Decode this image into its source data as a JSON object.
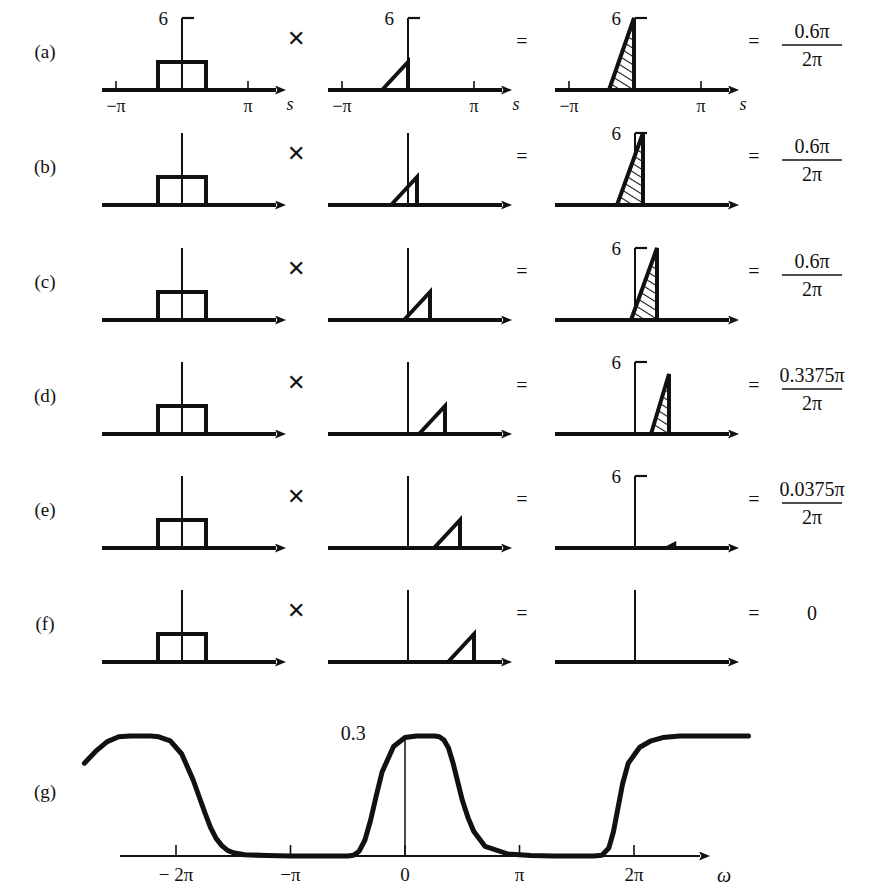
{
  "figure": {
    "kind": "graphical-convolution-illustration",
    "background": "#ffffff",
    "ink": "#111111",
    "rows": [
      {
        "id": "a",
        "label": "(a)",
        "operator_multiply": "✕",
        "operator_equals_1": "=",
        "operator_equals_2": "=",
        "panel1": {
          "peak_label": "6",
          "left_tick": "−π",
          "right_tick": "π",
          "axis_var": "s",
          "show_axis_labels": true
        },
        "panel2": {
          "peak_label": "6",
          "left_tick": "−π",
          "right_tick": "π",
          "axis_var": "s",
          "show_axis_labels": true
        },
        "panel3": {
          "peak_label": "6",
          "left_tick": "−π",
          "right_tick": "π",
          "axis_var": "s",
          "show_axis_labels": true
        },
        "result": {
          "numerator": "0.6π",
          "denominator": "2π",
          "is_fraction": true
        },
        "shift": 0
      },
      {
        "id": "b",
        "label": "(b)",
        "operator_multiply": "✕",
        "operator_equals_1": "=",
        "operator_equals_2": "=",
        "panel1": {
          "peak_label": "",
          "show_axis_labels": false
        },
        "panel2": {
          "peak_label": "",
          "show_axis_labels": false
        },
        "panel3": {
          "peak_label": "6",
          "show_axis_labels": false
        },
        "result": {
          "numerator": "0.6π",
          "denominator": "2π",
          "is_fraction": true
        },
        "shift": 1
      },
      {
        "id": "c",
        "label": "(c)",
        "operator_multiply": "✕",
        "operator_equals_1": "=",
        "operator_equals_2": "=",
        "panel1": {
          "peak_label": "",
          "show_axis_labels": false
        },
        "panel2": {
          "peak_label": "",
          "show_axis_labels": false
        },
        "panel3": {
          "peak_label": "6",
          "show_axis_labels": false
        },
        "result": {
          "numerator": "0.6π",
          "denominator": "2π",
          "is_fraction": true
        },
        "shift": 2
      },
      {
        "id": "d",
        "label": "(d)",
        "operator_multiply": "✕",
        "operator_equals_1": "=",
        "operator_equals_2": "=",
        "panel1": {
          "peak_label": "",
          "show_axis_labels": false
        },
        "panel2": {
          "peak_label": "",
          "show_axis_labels": false
        },
        "panel3": {
          "peak_label": "6",
          "show_axis_labels": false
        },
        "result": {
          "numerator": "0.3375π",
          "denominator": "2π",
          "is_fraction": true
        },
        "shift": 3
      },
      {
        "id": "e",
        "label": "(e)",
        "operator_multiply": "✕",
        "operator_equals_1": "=",
        "operator_equals_2": "=",
        "panel1": {
          "peak_label": "",
          "show_axis_labels": false
        },
        "panel2": {
          "peak_label": "",
          "show_axis_labels": false
        },
        "panel3": {
          "peak_label": "6",
          "show_axis_labels": false
        },
        "result": {
          "numerator": "0.0375π",
          "denominator": "2π",
          "is_fraction": true
        },
        "shift": 4
      },
      {
        "id": "f",
        "label": "(f)",
        "operator_multiply": "✕",
        "operator_equals_1": "=",
        "operator_equals_2": "=",
        "panel1": {
          "peak_label": "",
          "show_axis_labels": false
        },
        "panel2": {
          "peak_label": "",
          "show_axis_labels": false
        },
        "panel3": {
          "peak_label": "",
          "show_axis_labels": false
        },
        "result": {
          "value": "0",
          "is_fraction": false
        },
        "shift": 5
      }
    ],
    "bottom": {
      "label": "(g)",
      "peak_label": "0.3",
      "axis_var": "ω",
      "ticks": [
        "− 2π",
        "−π",
        "0",
        "π",
        "2π"
      ]
    }
  },
  "chart_data": {
    "type": "line",
    "title": "",
    "xlabel": "ω",
    "ylabel": "",
    "xlim": [
      -2.8,
      3.0
    ],
    "ylim": [
      0,
      0.36
    ],
    "grid": false,
    "legend": null,
    "xtick_values": [
      -2,
      -1,
      0,
      1,
      2
    ],
    "xtick_labels": [
      "− 2π",
      "−π",
      "0",
      "π",
      "2π"
    ],
    "annotations": [
      {
        "text": "0.3",
        "x": -0.22,
        "y": 0.3,
        "note": "passband peak amplitude"
      }
    ],
    "series": [
      {
        "name": "magnitude",
        "x": [
          -2.8,
          -2.7,
          -2.6,
          -2.5,
          -2.4,
          -2.3,
          -2.22,
          -2.15,
          -2.05,
          -1.95,
          -1.85,
          -1.8,
          -1.75,
          -1.7,
          -1.65,
          -1.6,
          -1.55,
          -1.5,
          -1.4,
          -1.2,
          -1.0,
          -0.8,
          -0.6,
          -0.5,
          -0.45,
          -0.4,
          -0.35,
          -0.3,
          -0.25,
          -0.2,
          -0.1,
          0.0,
          0.1,
          0.18,
          0.22,
          0.26,
          0.3,
          0.34,
          0.38,
          0.42,
          0.46,
          0.5,
          0.55,
          0.6,
          0.7,
          0.9,
          1.1,
          1.3,
          1.5,
          1.65,
          1.72,
          1.78,
          1.82,
          1.86,
          1.9,
          1.95,
          2.05,
          2.15,
          2.25,
          2.4,
          2.55,
          2.7,
          2.85,
          3.0
        ],
        "y": [
          0.232,
          0.262,
          0.286,
          0.298,
          0.3,
          0.3,
          0.3,
          0.298,
          0.288,
          0.255,
          0.19,
          0.15,
          0.11,
          0.072,
          0.044,
          0.026,
          0.014,
          0.008,
          0.003,
          0.001,
          0.0,
          0.0,
          0.0,
          0.0,
          0.002,
          0.012,
          0.04,
          0.09,
          0.152,
          0.21,
          0.274,
          0.296,
          0.3,
          0.3,
          0.3,
          0.3,
          0.298,
          0.29,
          0.27,
          0.232,
          0.186,
          0.14,
          0.096,
          0.062,
          0.024,
          0.005,
          0.001,
          0.0,
          0.0,
          0.0,
          0.002,
          0.02,
          0.06,
          0.12,
          0.18,
          0.232,
          0.272,
          0.288,
          0.296,
          0.3,
          0.3,
          0.3,
          0.3,
          0.3
        ]
      }
    ]
  }
}
